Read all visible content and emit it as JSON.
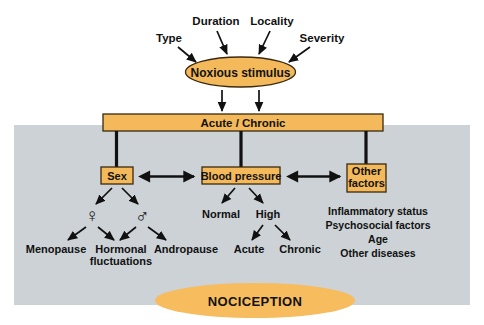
{
  "diagram": {
    "colors": {
      "node_fill": "#f3b95a",
      "node_stroke": "#3b2a10",
      "panel_background": "#ccd2d6",
      "canvas_background": "#ffffff",
      "line": "#111111",
      "text": "#111111"
    },
    "top_factors": [
      {
        "label": "Type"
      },
      {
        "label": "Duration"
      },
      {
        "label": "Locality"
      },
      {
        "label": "Severity"
      }
    ],
    "stimulus": {
      "label": "Noxious stimulus"
    },
    "timing_bar": {
      "label": "Acute / Chronic"
    },
    "branches": [
      {
        "node": "Sex",
        "children": [
          {
            "symbol": "♀",
            "symbol_name": "female-symbol",
            "leaves": [
              "Menopause",
              "Hormonal fluctuations"
            ]
          },
          {
            "symbol": "♂",
            "symbol_name": "male-symbol",
            "leaves": [
              "Hormonal fluctuations",
              "Andropause"
            ]
          }
        ]
      },
      {
        "node": "Blood pressure",
        "children": [
          {
            "symbol": "Normal",
            "leaves": []
          },
          {
            "symbol": "High",
            "leaves": [
              "Acute",
              "Chronic"
            ]
          }
        ]
      },
      {
        "node": "Other factors",
        "children": [],
        "list": [
          "Inflammatory status",
          "Psychosocial factors",
          "Age",
          "Other diseases"
        ]
      }
    ],
    "leaf_labels": {
      "menopause": "Menopause",
      "hormonal_line1": "Hormonal",
      "hormonal_line2": "fluctuations",
      "andropause": "Andropause",
      "normal": "Normal",
      "high": "High",
      "acute": "Acute",
      "chronic": "Chronic"
    },
    "other_factors_list": {
      "item0": "Inflammatory status",
      "item1": "Psychosocial factors",
      "item2": "Age",
      "item3": "Other diseases"
    },
    "node_labels": {
      "sex": "Sex",
      "blood_pressure": "Blood pressure",
      "other_line1": "Other",
      "other_line2": "factors"
    },
    "outcome": {
      "label": "NOCICEPTION"
    }
  }
}
